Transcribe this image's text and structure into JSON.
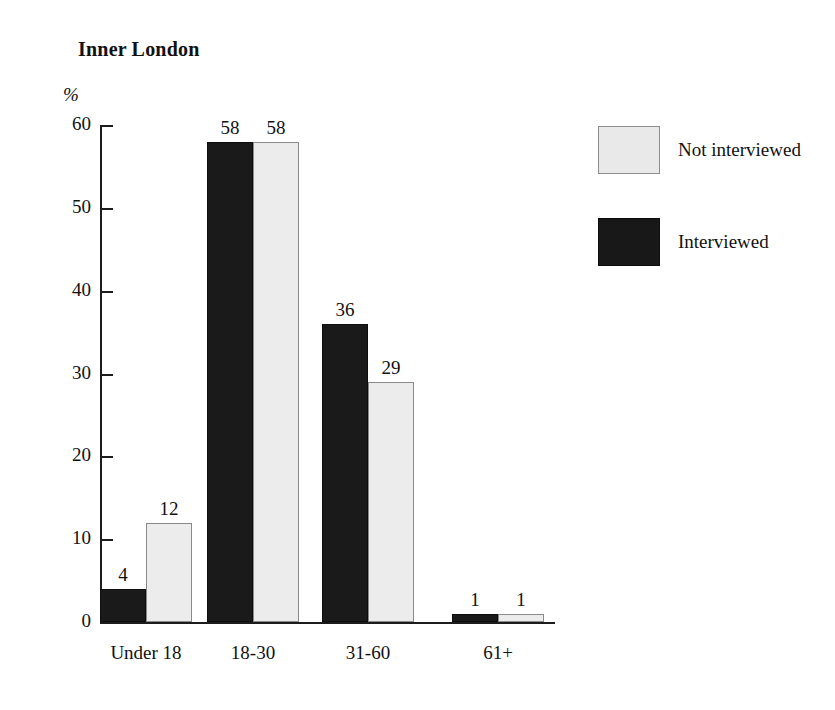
{
  "chart_data": {
    "type": "bar",
    "title": "Inner London",
    "xlabel": "",
    "ylabel": "%",
    "ylim": [
      0,
      60
    ],
    "yticks": [
      0,
      10,
      20,
      30,
      40,
      50,
      60
    ],
    "ytick_labels": [
      "0",
      "10",
      "20",
      "30",
      "40",
      "50",
      "60"
    ],
    "grid": false,
    "legend_position": "right",
    "categories": [
      "Under 18",
      "18-30",
      "31-60",
      "61+"
    ],
    "series": [
      {
        "name": "Interviewed",
        "color": "#1a1a1a",
        "values": [
          4,
          58,
          36,
          1
        ],
        "value_labels": [
          "4",
          "58",
          "36",
          "1"
        ]
      },
      {
        "name": "Not interviewed",
        "color": "#ececec",
        "values": [
          12,
          58,
          29,
          1
        ],
        "value_labels": [
          "12",
          "58",
          "29",
          "1"
        ]
      }
    ]
  },
  "legend": {
    "entries": [
      {
        "label": "Not interviewed",
        "swatch": "light"
      },
      {
        "label": "Interviewed",
        "swatch": "dark"
      }
    ]
  }
}
